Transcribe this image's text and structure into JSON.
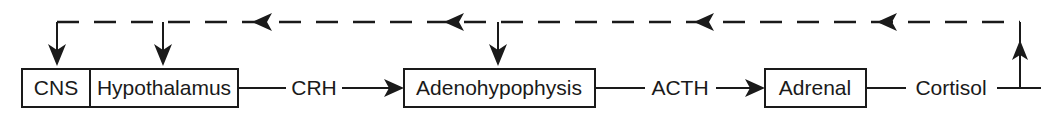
{
  "diagram": {
    "colors": {
      "ink": "#1a1a1a",
      "background": "#ffffff"
    },
    "nodes": [
      {
        "id": "cns",
        "label": "CNS"
      },
      {
        "id": "hypothalamus",
        "label": "Hypothalamus"
      },
      {
        "id": "adenohypophysis",
        "label": "Adenohypophysis"
      },
      {
        "id": "adrenal",
        "label": "Adrenal"
      }
    ],
    "mediators": [
      {
        "id": "crh",
        "label": "CRH"
      },
      {
        "id": "acth",
        "label": "ACTH"
      },
      {
        "id": "cortisol",
        "label": "Cortisol"
      }
    ],
    "flow": [
      {
        "from": "hypothalamus",
        "via": "CRH",
        "to": "adenohypophysis",
        "style": "solid-arrow"
      },
      {
        "from": "adenohypophysis",
        "via": "ACTH",
        "to": "adrenal",
        "style": "solid-arrow"
      },
      {
        "from": "adrenal",
        "via": "Cortisol",
        "to": "feedback-bus",
        "style": "solid-line"
      }
    ],
    "feedback": {
      "style": "dashed",
      "direction": "right-to-left",
      "description": "Cortisol negative feedback to CNS, hypothalamus and adenohypophysis",
      "targets": [
        "cns",
        "hypothalamus",
        "adenohypophysis"
      ],
      "arrowhead_count": 4
    }
  }
}
